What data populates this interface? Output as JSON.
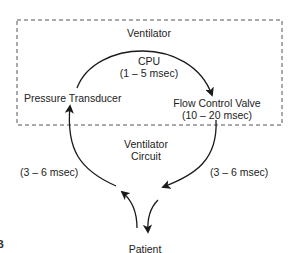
{
  "diagram": {
    "type": "feedback-loop",
    "container": {
      "label": "Ventilator",
      "style": "dashed-box"
    },
    "nodes": {
      "pressure_transducer": "Pressure Transducer",
      "cpu": {
        "label": "CPU",
        "delay": "(1 – 5 msec)"
      },
      "flow_control_valve": {
        "label": "Flow Control Valve",
        "delay": "(10 – 20 msec)"
      },
      "ventilator_circuit": {
        "line1": "Ventilator",
        "line2": "Circuit"
      },
      "patient": "Patient"
    },
    "edges": [
      {
        "from": "Pressure Transducer",
        "to": "Flow Control Valve",
        "via": "CPU",
        "delay": "(1 – 5 msec)"
      },
      {
        "from": "Flow Control Valve",
        "to": "Patient",
        "via": "Ventilator Circuit",
        "delay": "(3 – 6 msec)"
      },
      {
        "from": "Patient",
        "to": "Pressure Transducer",
        "via": "Ventilator Circuit",
        "delay": "(3 – 6 msec)"
      }
    ],
    "left_delay": "(3 – 6 msec)",
    "right_delay": "(3 – 6 msec)",
    "figure_letter": "B",
    "colors": {
      "line": "#1a1a1a",
      "dash": "#555555",
      "background": "#ffffff"
    }
  }
}
